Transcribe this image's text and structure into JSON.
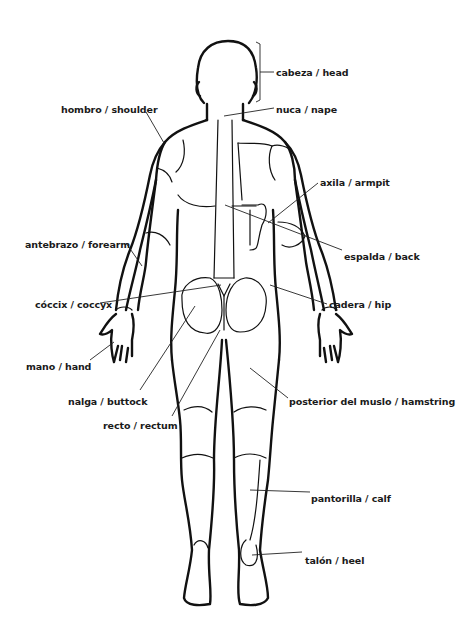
{
  "diagram": {
    "labels": [
      {
        "id": "head",
        "text": "cabeza / head",
        "x": 276,
        "y": 67
      },
      {
        "id": "shoulder",
        "text": "hombro / shoulder",
        "x": 61,
        "y": 104
      },
      {
        "id": "nape",
        "text": "nuca / nape",
        "x": 276,
        "y": 104
      },
      {
        "id": "armpit",
        "text": "axila / armpit",
        "x": 320,
        "y": 177
      },
      {
        "id": "forearm",
        "text": "antebrazo / forearm",
        "x": 25,
        "y": 239
      },
      {
        "id": "back",
        "text": "espalda / back",
        "x": 344,
        "y": 251
      },
      {
        "id": "coccyx",
        "text": "cóccix / coccyx",
        "x": 35,
        "y": 299
      },
      {
        "id": "hip",
        "text": "cadera / hip",
        "x": 329,
        "y": 299
      },
      {
        "id": "hand",
        "text": "mano / hand",
        "x": 26,
        "y": 361
      },
      {
        "id": "buttock",
        "text": "nalga / buttock",
        "x": 68,
        "y": 396
      },
      {
        "id": "hamstring",
        "text": "posterior del muslo / hamstring",
        "x": 289,
        "y": 396
      },
      {
        "id": "rectum",
        "text": "recto / rectum",
        "x": 103,
        "y": 420
      },
      {
        "id": "calf",
        "text": "pantorilla / calf",
        "x": 311,
        "y": 493
      },
      {
        "id": "heel",
        "text": "talón / heel",
        "x": 305,
        "y": 555
      }
    ]
  }
}
